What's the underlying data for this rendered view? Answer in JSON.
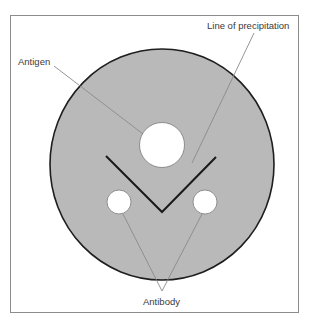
{
  "diagram": {
    "labels": {
      "antigen": "Antigen",
      "line_of_precipitation": "Line of precipitation",
      "antibody": "Antibody"
    },
    "colors": {
      "plate_fill": "#b9b9b9",
      "plate_stroke": "#1e1e1e",
      "well_fill": "#ffffff",
      "well_stroke": "#7a7a7a",
      "precipitation_line": "#1a1a1a",
      "leader_line": "#8a8a8a",
      "frame": "#8c8c8c",
      "text": "#3a3a3a"
    },
    "frame": {
      "x": 10.5,
      "y": 15.5,
      "width": 288,
      "height": 297
    },
    "plate": {
      "cx": 162,
      "cy": 164.5,
      "rx": 112,
      "ry": 115.5
    },
    "wells": {
      "antigen": {
        "cx": 162,
        "cy": 145,
        "r": 22.5
      },
      "antibody_left": {
        "cx": 119,
        "cy": 202,
        "r": 12
      },
      "antibody_right": {
        "cx": 205,
        "cy": 202,
        "r": 12
      }
    },
    "precipitation_line": {
      "points": "106,156 162,212 216,157"
    },
    "leaders": {
      "antigen": {
        "x1": 54,
        "y1": 66,
        "x2": 143,
        "y2": 134
      },
      "precipitation": {
        "x1": 254,
        "y1": 33,
        "x2": 192,
        "y2": 163
      },
      "antibody_left": {
        "x1": 123,
        "y1": 214,
        "x2": 162,
        "y2": 291
      },
      "antibody_right": {
        "x1": 202,
        "y1": 214,
        "x2": 162,
        "y2": 291
      }
    }
  }
}
